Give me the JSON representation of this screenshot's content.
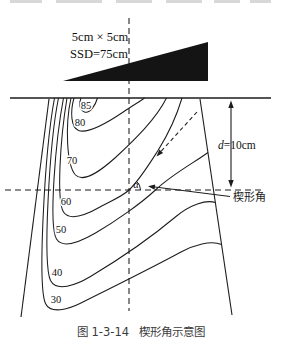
{
  "figure": {
    "beam": {
      "field_size": "5cm × 5cm",
      "ssd": "SSD=75cm"
    },
    "depth": {
      "d_italic": "d",
      "d_value": "=10cm"
    },
    "angle": {
      "alpha": "α",
      "wedge_angle_label": "楔形角"
    },
    "isodose_labels": [
      "85",
      "80",
      "70",
      "60",
      "50",
      "40",
      "30"
    ],
    "caption": {
      "number": "图 1-3-14",
      "title": "楔形角示意图"
    }
  },
  "colors": {
    "line": "#1c1c1c",
    "wedge_fill": "#141414",
    "caption_text": "#3b3b3b"
  }
}
